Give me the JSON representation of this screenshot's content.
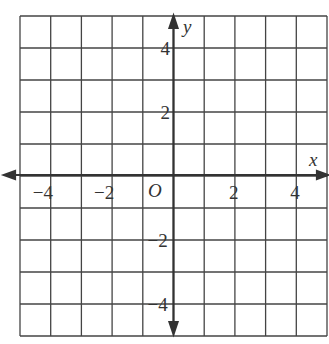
{
  "chart_data": {
    "type": "coordinate-grid",
    "title": "",
    "xlabel": "x",
    "ylabel": "y",
    "origin_label": "O",
    "xlim": [
      -5,
      5
    ],
    "ylim": [
      -5,
      5
    ],
    "grid": true,
    "grid_step": 1,
    "x_ticks": [
      {
        "value": -4,
        "label": "−4"
      },
      {
        "value": -2,
        "label": "−2"
      },
      {
        "value": 2,
        "label": "2"
      },
      {
        "value": 4,
        "label": "4"
      }
    ],
    "y_ticks": [
      {
        "value": 4,
        "label": "4"
      },
      {
        "value": 2,
        "label": "2"
      },
      {
        "value": -2,
        "label": "−2"
      },
      {
        "value": -4,
        "label": "−4"
      }
    ],
    "series": []
  },
  "colors": {
    "grid": "#444444",
    "axis": "#333333",
    "background": "#ffffff"
  }
}
